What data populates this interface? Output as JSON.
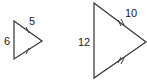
{
  "diagram": {
    "type": "similar-triangles",
    "colors": {
      "stroke": "#333333",
      "text": "#222222",
      "background": "#ffffff"
    },
    "small_triangle": {
      "vertices": [
        [
          14,
          21
        ],
        [
          42,
          41
        ],
        [
          14,
          59
        ]
      ],
      "labels": {
        "left_side": "6",
        "upper_side": "5"
      },
      "tick_marks": "single"
    },
    "large_triangle": {
      "vertices": [
        [
          94,
          3
        ],
        [
          146,
          42
        ],
        [
          94,
          78
        ]
      ],
      "labels": {
        "left_side": "12",
        "upper_side": "10"
      },
      "tick_marks": "double"
    }
  }
}
